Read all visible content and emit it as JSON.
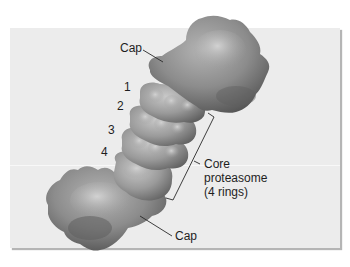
{
  "figure": {
    "background_color": "#ececec",
    "protein_color": "#8a8a8a",
    "labels": {
      "cap_top": "Cap",
      "cap_bottom": "Cap",
      "ring_1": "1",
      "ring_2": "2",
      "ring_3": "3",
      "ring_4": "4",
      "core_line1": "Core",
      "core_line2": "proteasome",
      "core_line3": "(4 rings)"
    }
  }
}
